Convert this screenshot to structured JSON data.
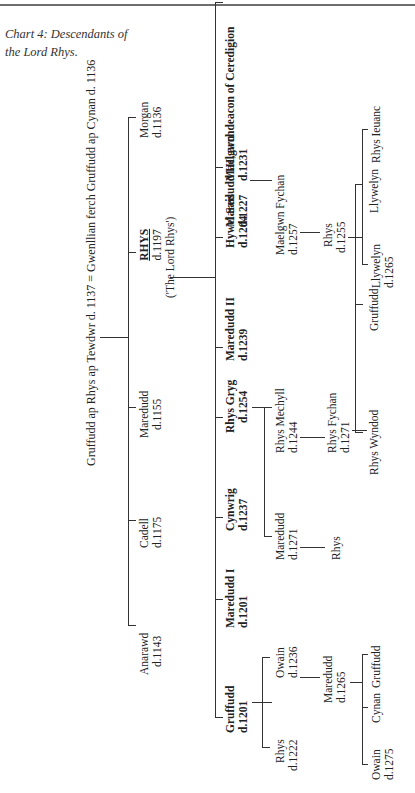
{
  "header": {
    "rule": true
  },
  "caption": {
    "line1": "Chart 4: Descendants of",
    "line2": "the Lord Rhys."
  },
  "chart": {
    "root": "Gruffudd ap Rhys ap Tewdwr d. 1137 = Gwenllian ferch Gruffudd ap Cynan d. 1136",
    "gen1": [
      {
        "name": "Anarawd",
        "date": "d.1143"
      },
      {
        "name": "Cadell",
        "date": "d.1175"
      },
      {
        "name": "Maredudd",
        "date": "d.1155"
      },
      {
        "name": "RHYS",
        "date": "d.1197",
        "note": "('The Lord Rhys')"
      },
      {
        "name": "Morgan",
        "date": "d.1136"
      }
    ],
    "gen2": [
      {
        "name": "Gruffudd",
        "date": "d.1201"
      },
      {
        "name": "Maredudd I",
        "date": "d.1201"
      },
      {
        "name": "Cynwrig",
        "date": "d.1237"
      },
      {
        "name": "Rhys Gryg",
        "date": "d.1254"
      },
      {
        "name": "Maredudd II",
        "date": "d.1239"
      },
      {
        "name": "Hywel Sais",
        "date": "d.1204"
      },
      {
        "name": "Maelgwn",
        "date": "d.1231"
      },
      {
        "name": "Maredudd III, archdeacon of Ceredigion",
        "date": "d.1227"
      }
    ],
    "gen3": [
      {
        "name": "Rhys",
        "date": "d.1222"
      },
      {
        "name": "Owain",
        "date": "d.1236"
      },
      {
        "name": "Maredudd",
        "date": "d.1271"
      },
      {
        "name": "Rhys Mechyll",
        "date": "d.1244"
      },
      {
        "name": "Maelgwn Fychan",
        "date": "d.1257"
      }
    ],
    "gen4": [
      {
        "name": "Maredudd",
        "date": "d.1265"
      },
      {
        "name": "Rhys",
        "date": ""
      },
      {
        "name": "Rhys Fychan",
        "date": "d.1271"
      },
      {
        "name": "Rhys",
        "date": "d.1255"
      }
    ],
    "gen5": [
      {
        "name": "Owain",
        "date": "d.1275"
      },
      {
        "name": "Cynan",
        "date": ""
      },
      {
        "name": "Gruffudd",
        "date": ""
      },
      {
        "name": "Rhys Wyndod",
        "date": ""
      },
      {
        "name": "Gruffudd",
        "date": ""
      },
      {
        "name": "Llywelyn",
        "date": ""
      },
      {
        "name": "Llywelyn",
        "date": "d.1265"
      },
      {
        "name": "Rhys Ieuanc",
        "date": ""
      }
    ]
  }
}
